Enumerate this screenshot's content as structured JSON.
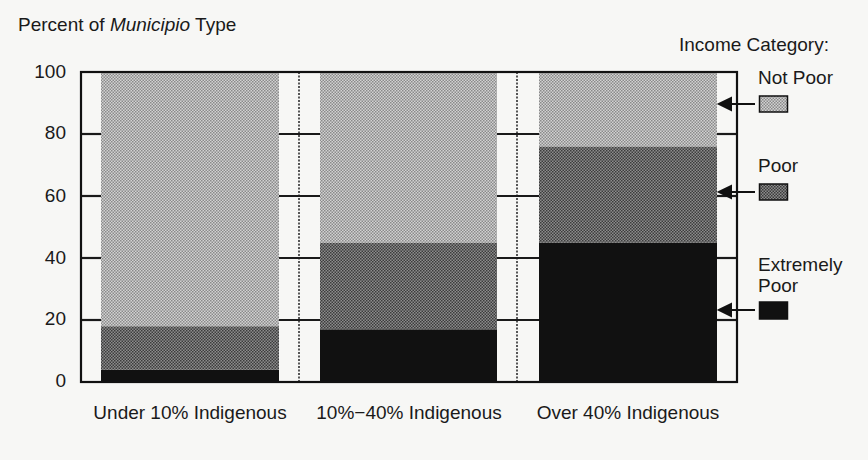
{
  "chart_data": {
    "type": "bar",
    "stacked": true,
    "title": "",
    "ylabel_prefix": "Percent of ",
    "ylabel_italic": "Municipio",
    "ylabel_suffix": " Type",
    "xlabel": "",
    "ylim": [
      0,
      100
    ],
    "yticks": [
      "100",
      "80",
      "60",
      "40",
      "20",
      "0"
    ],
    "categories": [
      "Under 10% Indigenous",
      "10%−40% Indigenous",
      "Over 40% Indigenous"
    ],
    "series": [
      {
        "name": "Extremely Poor",
        "values": [
          4,
          17,
          45
        ],
        "color": "#111111"
      },
      {
        "name": "Poor",
        "values": [
          14,
          28,
          31
        ],
        "color": "#6e6e6e"
      },
      {
        "name": "Not Poor",
        "values": [
          82,
          55,
          24
        ],
        "color": "#b4b4b4"
      }
    ],
    "grid": false,
    "legend": {
      "title": "Income Category:",
      "position": "right",
      "entries": [
        "Not Poor",
        "Poor",
        "Extremely Poor"
      ],
      "extremely_poor_line1": "Extremely",
      "extremely_poor_line2": "Poor"
    }
  }
}
